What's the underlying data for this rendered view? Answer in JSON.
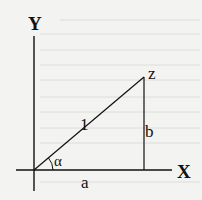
{
  "diagram": {
    "axes": {
      "x_label": "X",
      "y_label": "Y"
    },
    "points": {
      "z_label": "z"
    },
    "segments": {
      "hypotenuse_label": "1",
      "vertical_label": "b",
      "horizontal_label": "a"
    },
    "angle": {
      "label": "α"
    },
    "colors": {
      "stroke": "#111111",
      "background": "#f3f3f1"
    }
  }
}
